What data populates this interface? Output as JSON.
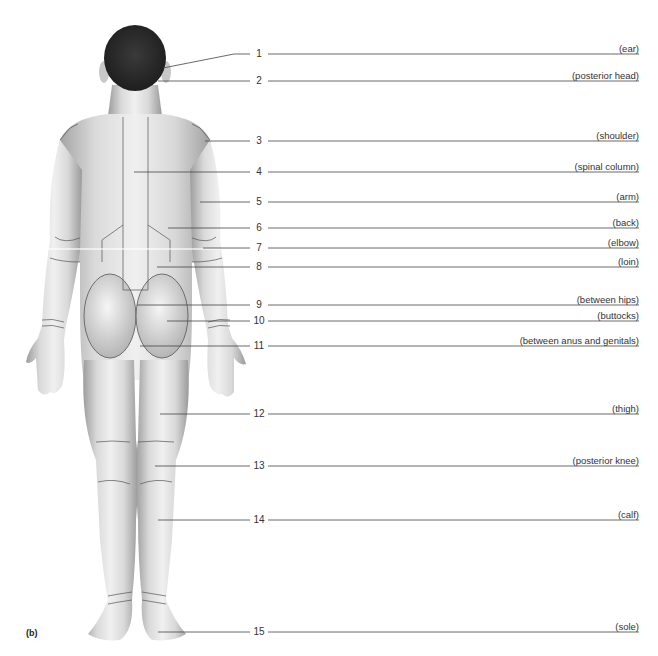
{
  "figure": {
    "panel_label": "(b)",
    "view": "posterior body",
    "colors": {
      "skin_light": "#eeeeee",
      "skin_shadow": "#9a9a9a",
      "hair": "#2a2a2a",
      "outline": "#555555",
      "leader": "#444444",
      "text": "#333333"
    }
  },
  "labels": [
    {
      "number": "1",
      "term": "(ear)",
      "y": 54,
      "target": [
        163,
        68
      ],
      "elbow_x": 234,
      "elbow_y": 54
    },
    {
      "number": "2",
      "term": "(posterior head)",
      "y": 81,
      "target": [
        158,
        81
      ]
    },
    {
      "number": "3",
      "term": "(shoulder)",
      "y": 141,
      "target": [
        205,
        141
      ]
    },
    {
      "number": "4",
      "term": "(spinal column)",
      "y": 172,
      "target": [
        134,
        172
      ]
    },
    {
      "number": "5",
      "term": "(arm)",
      "y": 202,
      "target": [
        200,
        202
      ]
    },
    {
      "number": "6",
      "term": "(back)",
      "y": 228,
      "target": [
        168,
        228
      ]
    },
    {
      "number": "7",
      "term": "(elbow)",
      "y": 248,
      "target": [
        203,
        248
      ]
    },
    {
      "number": "8",
      "term": "(loin)",
      "y": 267,
      "target": [
        157,
        267
      ]
    },
    {
      "number": "9",
      "term": "(between hips)",
      "y": 305,
      "target": [
        137,
        305
      ]
    },
    {
      "number": "10",
      "term": "(buttocks)",
      "y": 321,
      "target": [
        167,
        321
      ]
    },
    {
      "number": "11",
      "term": "(between anus and genitals)",
      "y": 346,
      "target": [
        140,
        346
      ]
    },
    {
      "number": "12",
      "term": "(thigh)",
      "y": 414,
      "target": [
        160,
        414
      ]
    },
    {
      "number": "13",
      "term": "(posterior knee)",
      "y": 466,
      "target": [
        155,
        466
      ]
    },
    {
      "number": "14",
      "term": "(calf)",
      "y": 520,
      "target": [
        158,
        520
      ]
    },
    {
      "number": "15",
      "term": "(sole)",
      "y": 632,
      "target": [
        158,
        632
      ]
    }
  ]
}
